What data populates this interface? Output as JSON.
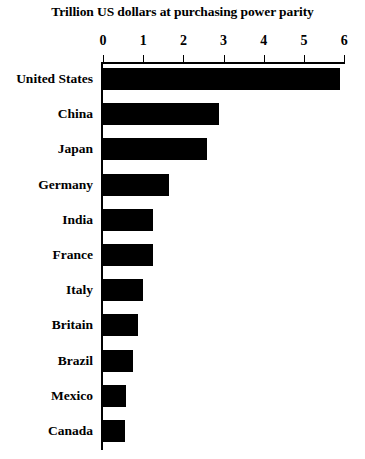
{
  "chart_data": {
    "type": "bar",
    "orientation": "horizontal",
    "title": "Trillion US dollars at purchasing power parity",
    "xlabel": "",
    "ylabel": "",
    "xlim": [
      0,
      6
    ],
    "xticks": [
      0,
      1,
      2,
      3,
      4,
      5,
      6
    ],
    "xtick_labels": [
      "0",
      "1",
      "2",
      "3",
      "4",
      "5",
      "6"
    ],
    "grid": false,
    "legend": null,
    "bar_color": "#000000",
    "background_color": "#ffffff",
    "categories": [
      "United States",
      "China",
      "Japan",
      "Germany",
      "India",
      "France",
      "Italy",
      "Britain",
      "Brazil",
      "Mexico",
      "Canada"
    ],
    "values": [
      5.9,
      2.88,
      2.58,
      1.63,
      1.25,
      1.25,
      1.0,
      0.88,
      0.75,
      0.57,
      0.55
    ]
  }
}
